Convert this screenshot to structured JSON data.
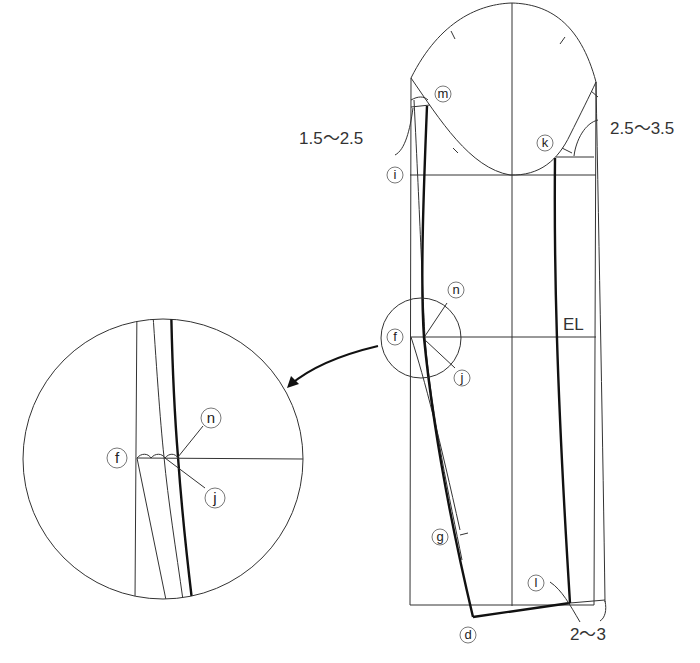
{
  "diagram": {
    "type": "sleeve-pattern-draft",
    "point_labels": {
      "m": "m",
      "k": "k",
      "i": "i",
      "n": "n",
      "f": "f",
      "j": "j",
      "g": "g",
      "l": "l",
      "d": "d"
    },
    "line_labels": {
      "elbow_line": "EL"
    },
    "measurements": {
      "front_cap_offset": "1.5〜2.5",
      "back_cap_offset": "2.5〜3.5",
      "hem_offset": "2〜3"
    },
    "detail_view": {
      "labels": {
        "f": "f",
        "n": "n",
        "j": "j"
      }
    },
    "colors": {
      "line": "#333333",
      "thick_line": "#111111",
      "background": "#ffffff"
    }
  }
}
